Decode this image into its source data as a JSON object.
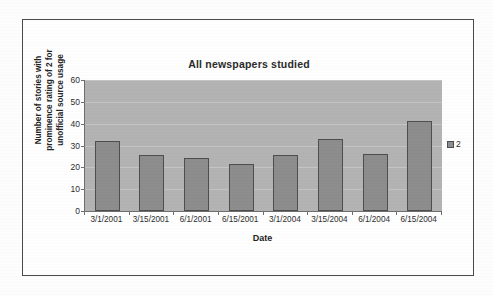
{
  "chart_data": {
    "type": "bar",
    "title": "All newspapers studied",
    "xlabel": "Date",
    "ylabel_lines": [
      "Number of stories with",
      "prominence rating of 2 for",
      "unofficial source usage"
    ],
    "ylabel": "Number of stories with prominence rating of 2 for unofficial source usage",
    "categories": [
      "3/1/2001",
      "3/15/2001",
      "6/1/2001",
      "6/15/2001",
      "3/1/2004",
      "3/15/2004",
      "6/1/2004",
      "6/15/2004"
    ],
    "series": [
      {
        "name": "2",
        "values": [
          32,
          25.5,
          24.5,
          21.5,
          25.5,
          33,
          26,
          41
        ]
      }
    ],
    "ylim": [
      0,
      60
    ],
    "yticks": [
      0,
      10,
      20,
      30,
      40,
      50,
      60
    ],
    "ytick_labels": [
      "0",
      "10",
      "20",
      "30",
      "40",
      "50",
      "60"
    ],
    "grid": true,
    "legend_position": "right",
    "legend_entries": [
      "2"
    ],
    "colors": {
      "bar_fill": "#8d8d8d",
      "bar_outline": "#4e4e4e",
      "plot_background": "#b3b3b3",
      "gridline": "#c4c4c4",
      "axis": "#6e6e6e",
      "text": "#2d2d2d",
      "frame": "#4a4a4a",
      "page_background": "#fdfdfd"
    }
  },
  "legend": {
    "swatch_name": "legend-swatch-series-2",
    "label": "2"
  }
}
